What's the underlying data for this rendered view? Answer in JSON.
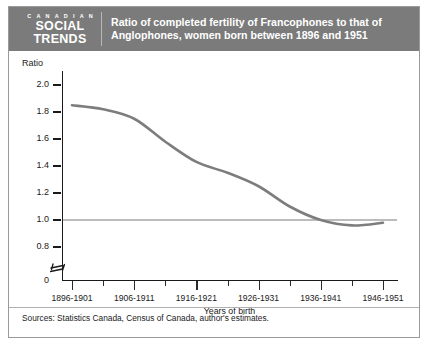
{
  "branding": {
    "kicker": "C A N A D I A N",
    "line1": "SOCIAL",
    "line2": "TRENDS"
  },
  "header": {
    "title_line1": "Ratio of completed fertility of Francophones to that of",
    "title_line2": "Anglophones, women born between 1896 and 1951",
    "banner_color": "#7b7b7b"
  },
  "footer": {
    "sources": "Sources: Statistics Canada, Census of Canada, author's estimates."
  },
  "chart_data": {
    "type": "line",
    "title": "Ratio of completed fertility of Francophones to that of Anglophones, women born between 1896 and 1951",
    "xlabel": "Years of birth",
    "ylabel": "Ratio",
    "ylim": [
      0.8,
      2.0
    ],
    "grid": false,
    "legend": null,
    "axis_break": true,
    "axis_break_note": "y-axis broken between 0 and 0.8",
    "yticks": [
      "2.0",
      "1.8",
      "1.6",
      "1.4",
      "1.2",
      "1.0",
      "0.8"
    ],
    "ytick_values": [
      2.0,
      1.8,
      1.6,
      1.4,
      1.2,
      1.0,
      0.8
    ],
    "yaxis_origin_label": "0",
    "xtick_labels": [
      "1896-1901",
      "1906-1911",
      "1916-1921",
      "1926-1931",
      "1936-1941",
      "1946-1951"
    ],
    "categories": [
      "1896-1901",
      "1901-1906",
      "1906-1911",
      "1911-1916",
      "1916-1921",
      "1921-1926",
      "1926-1931",
      "1931-1936",
      "1936-1941",
      "1941-1946",
      "1946-1951"
    ],
    "values": [
      1.85,
      1.82,
      1.75,
      1.58,
      1.43,
      1.35,
      1.25,
      1.1,
      1.0,
      0.96,
      0.98
    ],
    "series_color": "#7d7d7d",
    "reference_line": {
      "value": 1.0,
      "color": "#bcbcbc",
      "label": "1.0"
    }
  }
}
